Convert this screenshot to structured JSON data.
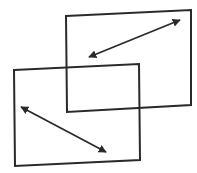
{
  "diagram": {
    "stroke_color": "#2a2a2a",
    "fill_color": "#ffffff",
    "background": "#ffffff",
    "shapes": [
      {
        "id": "back-frame",
        "type": "quadrilateral",
        "points": [
          [
            66,
            16
          ],
          [
            191,
            10
          ],
          [
            191,
            105
          ],
          [
            67,
            112
          ]
        ]
      },
      {
        "id": "front-frame",
        "type": "quadrilateral",
        "points": [
          [
            14,
            70
          ],
          [
            139,
            64
          ],
          [
            140,
            160
          ],
          [
            15,
            166
          ]
        ]
      }
    ],
    "arrows": [
      {
        "id": "back-arrow",
        "type": "double-headed",
        "from": [
          89,
          57
        ],
        "to": [
          180,
          20
        ]
      },
      {
        "id": "front-arrow",
        "type": "double-headed",
        "from": [
          21,
          107
        ],
        "to": [
          106,
          152
        ]
      }
    ]
  }
}
